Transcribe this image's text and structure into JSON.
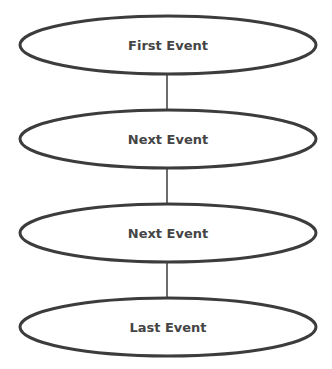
{
  "diagram": {
    "type": "vertical-event-sequence",
    "nodes": [
      {
        "id": "first",
        "label": "First Event",
        "shape": "ellipse"
      },
      {
        "id": "next-1",
        "label": "Next Event",
        "shape": "ellipse"
      },
      {
        "id": "next-2",
        "label": "Next Event",
        "shape": "ellipse"
      },
      {
        "id": "last",
        "label": "Last Event",
        "shape": "ellipse"
      }
    ],
    "edges": [
      {
        "from": "first",
        "to": "next-1"
      },
      {
        "from": "next-1",
        "to": "next-2"
      },
      {
        "from": "next-2",
        "to": "last"
      }
    ],
    "colors": {
      "stroke": "#3c3c3c",
      "text": "#454545",
      "fill": "#ffffff",
      "background": "#ffffff"
    }
  }
}
